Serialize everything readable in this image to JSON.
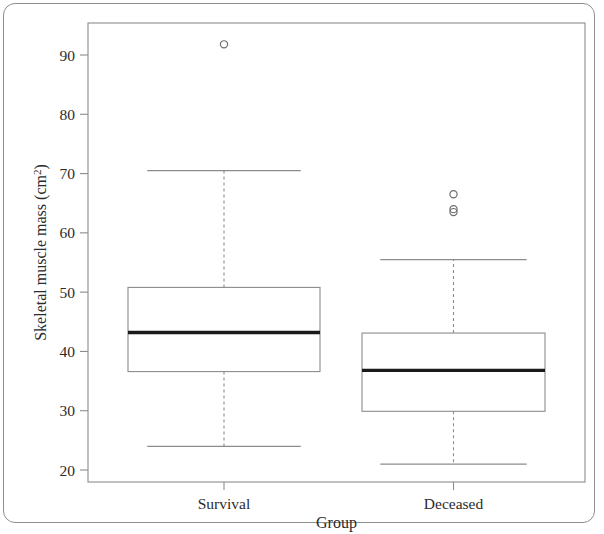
{
  "chart_data": {
    "type": "box",
    "title": "",
    "xlabel": "Group",
    "ylabel": "Skeletal muscle mass (cm²)",
    "ylabel_parts": {
      "base": "Skeletal muscle mass (cm",
      "superscript": "2",
      "close": ")"
    },
    "categories": [
      "Survival",
      "Deceased"
    ],
    "ylim": [
      17.5,
      95.5
    ],
    "yticks": [
      20,
      30,
      40,
      50,
      60,
      70,
      80,
      90
    ],
    "ytick_labels": [
      "20",
      "30",
      "40",
      "50",
      "60",
      "70",
      "80",
      "90"
    ],
    "grid": false,
    "legend": "none",
    "boxes": [
      {
        "name": "Survival",
        "whisker_low": 24.0,
        "q1": 36.6,
        "median": 43.2,
        "q3": 50.8,
        "whisker_high": 70.5,
        "outliers": [
          91.8
        ]
      },
      {
        "name": "Deceased",
        "whisker_low": 21.0,
        "q1": 29.9,
        "median": 36.8,
        "q3": 43.1,
        "whisker_high": 55.5,
        "outliers": [
          66.5,
          64.0,
          63.5
        ]
      }
    ],
    "colors": {
      "frame": "#8c8c8c",
      "box_stroke": "#8c8c8c",
      "median": "#1a1a1a",
      "whisker": "#8c8c8c",
      "outlier": "#6e6e6e",
      "text": "#2b2b2b",
      "background": "#ffffff"
    }
  },
  "figure": {
    "border_color": "#8e8e8e"
  }
}
